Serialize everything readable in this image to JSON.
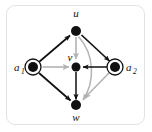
{
  "figure": {
    "type": "directed-graph-diagram",
    "frame": {
      "border_color": "#e3e3e3",
      "background_color": "#ffffff",
      "corner_radius": 9
    },
    "colors": {
      "node_fill": "#111111",
      "edge_black": "#111111",
      "edge_gray": "#b3b3b3",
      "ring_stroke": "#111111"
    },
    "nodes": [
      {
        "id": "u",
        "label": "u",
        "subscript": "",
        "shape": "filled-circle",
        "x": 76,
        "y": 31,
        "radius": 5,
        "label_position": "above"
      },
      {
        "id": "a1",
        "label": "a",
        "subscript": "1",
        "shape": "filled-circle-with-ring",
        "x": 33,
        "y": 67,
        "radius": 5,
        "ring_radius": 8,
        "label_position": "left"
      },
      {
        "id": "v",
        "label": "v",
        "subscript": "",
        "shape": "filled-circle",
        "x": 76,
        "y": 67,
        "radius": 4.5,
        "label_position": "above-left"
      },
      {
        "id": "a2",
        "label": "a",
        "subscript": "2",
        "shape": "filled-circle-with-ring",
        "x": 115,
        "y": 67,
        "radius": 5,
        "ring_radius": 8,
        "label_position": "right"
      },
      {
        "id": "w",
        "label": "w",
        "subscript": "",
        "shape": "filled-circle",
        "x": 76,
        "y": 105,
        "radius": 5,
        "label_position": "below"
      }
    ],
    "edges": [
      {
        "from": "a1",
        "to": "u",
        "color": "black",
        "style": "straight",
        "arrow": "end"
      },
      {
        "from": "u",
        "to": "a2",
        "color": "black",
        "style": "straight",
        "arrow": "end"
      },
      {
        "from": "a1",
        "to": "w",
        "color": "black",
        "style": "straight",
        "arrow": "end"
      },
      {
        "from": "a2",
        "to": "v",
        "color": "black",
        "style": "straight",
        "arrow": "end"
      },
      {
        "from": "v",
        "to": "w",
        "color": "black",
        "style": "straight",
        "arrow": "end"
      },
      {
        "from": "a1",
        "to": "v",
        "color": "gray",
        "style": "straight",
        "arrow": "end"
      },
      {
        "from": "u",
        "to": "v",
        "color": "gray",
        "style": "straight",
        "arrow": "end"
      },
      {
        "from": "u",
        "to": "w",
        "color": "gray",
        "style": "curved-right",
        "arrow": "end"
      },
      {
        "from": "a2",
        "to": "w",
        "color": "gray",
        "style": "straight",
        "arrow": "end"
      }
    ]
  }
}
